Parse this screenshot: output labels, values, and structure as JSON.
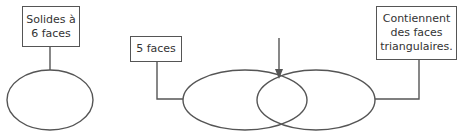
{
  "diagram": {
    "type": "venn-with-labels",
    "labels": {
      "six_faces": "Solides à\n6 faces",
      "five_faces": "5 faces",
      "triangular": "Contiennent\ndes faces\ntriangulaires."
    },
    "colors": {
      "stroke": "#555555",
      "text": "#333333",
      "background": "#ffffff"
    }
  }
}
